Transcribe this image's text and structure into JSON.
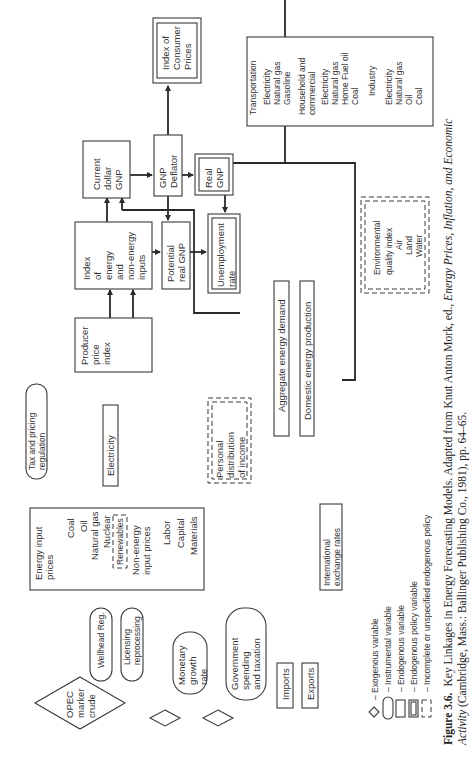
{
  "figure": {
    "number": "Figure 3.6.",
    "caption_line1": "Key Linkages in Energy Forecasting Models. Adapted from Knut Anton Mork, ed., Energy Prices, Inflation, and Economic",
    "caption_line1_plain": "Key Linkages in Energy Forecasting Models. Adapted from Knut Anton Mork, ed., ",
    "caption_line1_italic": "Energy Prices, Inflation, and Economic",
    "caption_line2_italic": "Activity",
    "caption_line2_plain": " (Cambridge, Mass.: Ballinger Publishing Co., 1981), pp. 64–65."
  },
  "nodes": {
    "index_consumer_prices": [
      "Index of",
      "Consumer",
      "Prices"
    ],
    "current_dollar_gnp": [
      "Current",
      "dollar",
      "GNP"
    ],
    "gnp_deflator": [
      "GNP",
      "Deflator"
    ],
    "real_gnp": [
      "Real",
      "GNP"
    ],
    "index_energy_inputs": [
      "Index",
      "of",
      "energy",
      "and",
      "non-energy",
      "inputs"
    ],
    "potential_real_gnp": [
      "Potential",
      "real GNP"
    ],
    "unemployment_rate": [
      "Unemployment",
      "rate"
    ],
    "producer_price_index": [
      "Producer",
      "price",
      "index"
    ],
    "tax_pricing_regulation": [
      "Tax and pricing",
      "regulation"
    ],
    "electricity": "Electricity",
    "personal_distribution_income": [
      "Personal",
      "distribution",
      "of income"
    ],
    "aggregate_energy_demand": "Aggregate energy demand",
    "domestic_energy_production": "Domestic energy production",
    "energy_input_prices": {
      "title": [
        "Energy input",
        "prices"
      ],
      "items": [
        "Coal",
        "Oil",
        "Natural gas",
        "Nuclear"
      ],
      "renewables": "Renewables",
      "non_energy_title": [
        "Non-energy",
        "input prices"
      ],
      "non_energy_items": [
        "Labor",
        "Capital",
        "Materials"
      ]
    },
    "international_exchange_rates": [
      "International",
      "exchange rates"
    ],
    "wellhead_reg": "Wellhead Reg.",
    "licensing_reprocessing": [
      "Licensing",
      "reprocessing"
    ],
    "opec_marker_crude": [
      "OPEC",
      "marker",
      "crude"
    ],
    "monetary_growth_rate": [
      "Monetary",
      "growth",
      "rate"
    ],
    "government_spending_taxation": [
      "Government",
      "spending",
      "and taxation"
    ],
    "imports": "Imports",
    "exports": "Exports",
    "sector_demand": [
      "Transportation",
      "  Electricity",
      "  Natural gas",
      "  Gasoline",
      "Household and",
      "commercial",
      "  Electricity",
      "  Natural gas",
      "  Home Fuel oil",
      "  Coal",
      "Industry",
      "  Electricity",
      "  Natural gas",
      "  Oil",
      "  Coal"
    ],
    "environmental_quality_index": [
      "Environmental",
      "quality index",
      "Air",
      "Land",
      "Water"
    ]
  },
  "legend": [
    {
      "symbol": "diamond",
      "label": "– Exogenous variable"
    },
    {
      "symbol": "rounded",
      "label": "– Instrumental variable"
    },
    {
      "symbol": "box",
      "label": "– Endogenous variable"
    },
    {
      "symbol": "double-box",
      "label": "– Endogenous policy variable"
    },
    {
      "symbol": "dashed-box",
      "label": "– Incomplete or unspecified endogenous policy"
    }
  ]
}
